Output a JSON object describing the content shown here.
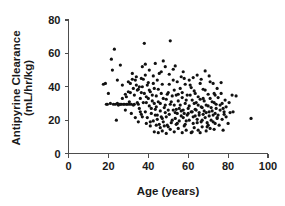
{
  "chart_data": {
    "type": "scatter",
    "title": "",
    "xlabel": "Age (years)",
    "ylabel_line1": "Antipyrine Clearance",
    "ylabel_line2": "(mL/hr/kg)",
    "ylabel": "Antipyrine Clearance (mL/hr/kg)",
    "xlim": [
      0,
      100
    ],
    "ylim": [
      0,
      80
    ],
    "xticks": [
      0,
      20,
      40,
      60,
      80,
      100
    ],
    "yticks": [
      0,
      20,
      40,
      60,
      80
    ],
    "xtick_labels": [
      "0",
      "20",
      "40",
      "60",
      "80",
      "100"
    ],
    "ytick_labels": [
      "0",
      "20",
      "40",
      "60",
      "80"
    ],
    "grid": false,
    "legend": false,
    "marker": "filled-circle",
    "marker_color": "#111111",
    "marker_size_px": 2.0,
    "n_points": 268,
    "points": [
      [
        17.5,
        41.5
      ],
      [
        18.5,
        42.0
      ],
      [
        19.0,
        29.5
      ],
      [
        19.5,
        29.5
      ],
      [
        20.0,
        36.0
      ],
      [
        21.0,
        30.0
      ],
      [
        21.5,
        56.5
      ],
      [
        22.0,
        50.0
      ],
      [
        22.5,
        29.5
      ],
      [
        23.0,
        62.5
      ],
      [
        23.5,
        29.5
      ],
      [
        24.0,
        20.0
      ],
      [
        24.5,
        30.0
      ],
      [
        25.0,
        29.0
      ],
      [
        25.5,
        29.5
      ],
      [
        26.0,
        29.5
      ],
      [
        26.5,
        29.5
      ],
      [
        27.0,
        41.0
      ],
      [
        27.5,
        29.5
      ],
      [
        28.0,
        29.5
      ],
      [
        28.5,
        35.5
      ],
      [
        29.0,
        29.5
      ],
      [
        29.5,
        29.5
      ],
      [
        30.0,
        43.0
      ],
      [
        30.5,
        29.5
      ],
      [
        31.0,
        36.5
      ],
      [
        31.5,
        29.5
      ],
      [
        32.0,
        48.0
      ],
      [
        32.5,
        39.0
      ],
      [
        33.0,
        29.5
      ],
      [
        33.5,
        44.0
      ],
      [
        34.0,
        46.0
      ],
      [
        34.5,
        38.0
      ],
      [
        35.0,
        29.5
      ],
      [
        35.5,
        40.0
      ],
      [
        36.0,
        25.0
      ],
      [
        36.5,
        36.5
      ],
      [
        37.0,
        22.0
      ],
      [
        37.5,
        44.5
      ],
      [
        38.0,
        66.0
      ],
      [
        38.5,
        53.5
      ],
      [
        39.0,
        30.5
      ],
      [
        39.5,
        41.0
      ],
      [
        40.0,
        33.0
      ],
      [
        40.5,
        38.0
      ],
      [
        41.0,
        19.0
      ],
      [
        41.5,
        27.0
      ],
      [
        42.0,
        35.0
      ],
      [
        42.5,
        42.0
      ],
      [
        43.0,
        30.0
      ],
      [
        43.5,
        23.0
      ],
      [
        44.0,
        34.5
      ],
      [
        44.5,
        20.5
      ],
      [
        45.0,
        31.0
      ],
      [
        45.5,
        48.0
      ],
      [
        46.0,
        25.5
      ],
      [
        46.5,
        36.0
      ],
      [
        47.0,
        21.0
      ],
      [
        47.5,
        33.0
      ],
      [
        48.0,
        16.5
      ],
      [
        48.5,
        29.0
      ],
      [
        49.0,
        22.0
      ],
      [
        49.5,
        35.5
      ],
      [
        50.0,
        26.0
      ],
      [
        50.5,
        41.5
      ],
      [
        51.0,
        67.5
      ],
      [
        51.5,
        31.0
      ],
      [
        52.0,
        20.0
      ],
      [
        52.5,
        44.0
      ],
      [
        53.0,
        29.0
      ],
      [
        53.5,
        24.5
      ],
      [
        54.0,
        35.0
      ],
      [
        54.5,
        18.0
      ],
      [
        55.0,
        31.5
      ],
      [
        55.5,
        27.0
      ],
      [
        56.0,
        39.0
      ],
      [
        56.5,
        22.5
      ],
      [
        57.0,
        33.5
      ],
      [
        57.5,
        26.0
      ],
      [
        58.0,
        45.0
      ],
      [
        58.5,
        30.0
      ],
      [
        59.0,
        19.5
      ],
      [
        59.5,
        35.0
      ],
      [
        60.0,
        24.0
      ],
      [
        60.5,
        28.5
      ],
      [
        61.0,
        41.0
      ],
      [
        61.5,
        12.5
      ],
      [
        62.0,
        32.0
      ],
      [
        62.5,
        22.0
      ],
      [
        63.0,
        37.5
      ],
      [
        63.5,
        26.5
      ],
      [
        64.0,
        30.5
      ],
      [
        64.5,
        18.5
      ],
      [
        65.0,
        34.0
      ],
      [
        65.5,
        23.0
      ],
      [
        66.0,
        42.0
      ],
      [
        66.5,
        28.0
      ],
      [
        67.0,
        20.0
      ],
      [
        67.5,
        33.0
      ],
      [
        68.0,
        25.5
      ],
      [
        68.5,
        38.0
      ],
      [
        69.0,
        29.0
      ],
      [
        69.5,
        16.0
      ],
      [
        70.0,
        35.5
      ],
      [
        70.5,
        22.5
      ],
      [
        71.0,
        43.0
      ],
      [
        71.5,
        27.5
      ],
      [
        72.0,
        31.0
      ],
      [
        72.5,
        19.0
      ],
      [
        73.0,
        36.0
      ],
      [
        73.5,
        24.0
      ],
      [
        74.0,
        29.5
      ],
      [
        74.5,
        21.0
      ],
      [
        75.0,
        33.5
      ],
      [
        75.5,
        17.0
      ],
      [
        76.0,
        26.0
      ],
      [
        76.5,
        42.5
      ],
      [
        77.0,
        30.0
      ],
      [
        77.5,
        14.0
      ],
      [
        78.0,
        23.5
      ],
      [
        79.0,
        28.0
      ],
      [
        80.0,
        18.0
      ],
      [
        81.0,
        24.5
      ],
      [
        82.0,
        35.0
      ],
      [
        84.0,
        34.5
      ],
      [
        91.5,
        21.0
      ],
      [
        30.0,
        37.0
      ],
      [
        31.0,
        42.0
      ],
      [
        32.0,
        44.5
      ],
      [
        33.0,
        35.0
      ],
      [
        34.0,
        41.0
      ],
      [
        35.0,
        38.5
      ],
      [
        36.0,
        33.0
      ],
      [
        37.0,
        40.0
      ],
      [
        38.0,
        36.0
      ],
      [
        39.0,
        34.0
      ],
      [
        40.0,
        42.5
      ],
      [
        41.0,
        37.0
      ],
      [
        42.0,
        31.5
      ],
      [
        43.0,
        39.0
      ],
      [
        44.0,
        28.0
      ],
      [
        45.0,
        38.5
      ],
      [
        46.0,
        30.0
      ],
      [
        47.0,
        41.5
      ],
      [
        48.0,
        27.5
      ],
      [
        49.0,
        32.5
      ],
      [
        50.0,
        36.5
      ],
      [
        51.0,
        29.5
      ],
      [
        52.0,
        34.5
      ],
      [
        53.0,
        38.0
      ],
      [
        54.0,
        26.5
      ],
      [
        55.0,
        35.5
      ],
      [
        56.0,
        29.0
      ],
      [
        57.0,
        36.5
      ],
      [
        58.0,
        24.0
      ],
      [
        59.0,
        32.0
      ],
      [
        60.0,
        27.0
      ],
      [
        61.0,
        35.0
      ],
      [
        62.0,
        25.0
      ],
      [
        63.0,
        30.0
      ],
      [
        64.0,
        26.0
      ],
      [
        65.0,
        29.0
      ],
      [
        66.0,
        32.5
      ],
      [
        67.0,
        27.5
      ],
      [
        68.0,
        31.5
      ],
      [
        69.0,
        24.5
      ],
      [
        70.0,
        28.5
      ],
      [
        71.0,
        33.0
      ],
      [
        72.0,
        25.5
      ],
      [
        73.0,
        30.5
      ],
      [
        74.0,
        27.0
      ],
      [
        75.0,
        23.0
      ],
      [
        76.0,
        29.0
      ],
      [
        77.0,
        20.5
      ],
      [
        78.0,
        25.0
      ],
      [
        79.0,
        22.0
      ],
      [
        35.5,
        27.0
      ],
      [
        36.5,
        23.5
      ],
      [
        37.5,
        30.5
      ],
      [
        38.5,
        25.0
      ],
      [
        39.5,
        21.5
      ],
      [
        40.5,
        28.5
      ],
      [
        41.5,
        24.0
      ],
      [
        42.5,
        19.5
      ],
      [
        43.5,
        26.5
      ],
      [
        44.5,
        23.0
      ],
      [
        45.5,
        17.5
      ],
      [
        46.5,
        22.0
      ],
      [
        47.5,
        19.0
      ],
      [
        48.5,
        24.5
      ],
      [
        49.5,
        17.0
      ],
      [
        50.5,
        23.5
      ],
      [
        51.5,
        18.5
      ],
      [
        52.5,
        26.0
      ],
      [
        53.5,
        21.0
      ],
      [
        54.5,
        24.0
      ],
      [
        55.5,
        19.5
      ],
      [
        56.5,
        25.5
      ],
      [
        57.5,
        21.5
      ],
      [
        58.5,
        17.5
      ],
      [
        59.5,
        23.0
      ],
      [
        60.5,
        20.0
      ],
      [
        61.5,
        25.0
      ],
      [
        62.5,
        18.0
      ],
      [
        63.5,
        22.5
      ],
      [
        64.5,
        20.5
      ],
      [
        65.5,
        24.5
      ],
      [
        66.5,
        19.0
      ],
      [
        67.5,
        23.5
      ],
      [
        68.5,
        21.5
      ],
      [
        69.5,
        18.5
      ],
      [
        70.5,
        25.0
      ],
      [
        71.5,
        20.0
      ],
      [
        72.5,
        23.0
      ],
      [
        73.5,
        18.0
      ],
      [
        74.5,
        21.5
      ],
      [
        43.0,
        13.0
      ],
      [
        45.0,
        12.5
      ],
      [
        47.0,
        13.5
      ],
      [
        49.0,
        12.0
      ],
      [
        51.0,
        14.5
      ],
      [
        53.0,
        13.0
      ],
      [
        55.0,
        15.0
      ],
      [
        57.0,
        12.5
      ],
      [
        59.0,
        14.0
      ],
      [
        63.0,
        15.5
      ],
      [
        65.0,
        14.0
      ],
      [
        67.0,
        16.0
      ],
      [
        69.0,
        13.5
      ],
      [
        71.0,
        15.0
      ],
      [
        73.0,
        14.5
      ],
      [
        24.5,
        44.0
      ],
      [
        27.0,
        33.0
      ],
      [
        29.0,
        34.0
      ],
      [
        30.5,
        31.0
      ],
      [
        32.5,
        29.0
      ],
      [
        34.5,
        30.5
      ],
      [
        36.5,
        45.0
      ],
      [
        38.5,
        47.0
      ],
      [
        40.5,
        50.0
      ],
      [
        42.5,
        46.5
      ],
      [
        44.5,
        44.0
      ],
      [
        46.5,
        49.0
      ],
      [
        48.5,
        52.0
      ],
      [
        50.5,
        47.5
      ],
      [
        52.5,
        50.5
      ],
      [
        54.5,
        43.0
      ],
      [
        56.5,
        46.0
      ],
      [
        58.5,
        41.5
      ],
      [
        60.5,
        44.0
      ],
      [
        62.5,
        45.5
      ],
      [
        64.5,
        47.0
      ],
      [
        66.5,
        44.5
      ],
      [
        68.5,
        49.5
      ],
      [
        70.5,
        46.5
      ],
      [
        72.5,
        42.0
      ],
      [
        74.5,
        39.0
      ],
      [
        76.5,
        36.0
      ],
      [
        78.5,
        32.0
      ],
      [
        80.5,
        30.5
      ],
      [
        82.5,
        25.0
      ],
      [
        26.0,
        53.0
      ],
      [
        28.5,
        26.0
      ],
      [
        31.5,
        24.0
      ],
      [
        33.5,
        21.5
      ],
      [
        35.0,
        19.0
      ],
      [
        39.0,
        18.0
      ],
      [
        41.0,
        16.5
      ],
      [
        44.0,
        17.0
      ],
      [
        46.0,
        15.5
      ],
      [
        50.0,
        16.0
      ],
      [
        54.0,
        17.5
      ],
      [
        58.0,
        16.5
      ],
      [
        62.0,
        13.0
      ],
      [
        66.0,
        12.5
      ],
      [
        70.0,
        17.0
      ],
      [
        37.0,
        52.0
      ],
      [
        43.5,
        54.0
      ],
      [
        47.5,
        55.5
      ],
      [
        53.5,
        52.5
      ],
      [
        57.5,
        49.0
      ],
      [
        61.5,
        39.5
      ],
      [
        63.5,
        36.0
      ],
      [
        67.5,
        38.5
      ],
      [
        73.5,
        35.0
      ],
      [
        77.5,
        27.0
      ]
    ]
  }
}
